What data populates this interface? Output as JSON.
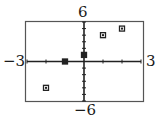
{
  "chart_data": {
    "type": "scatter",
    "title": "",
    "xlabel": "",
    "ylabel": "",
    "xlim": [
      -3,
      3
    ],
    "ylim": [
      -6,
      6
    ],
    "xscale": 1,
    "yscale": 1,
    "grid": false,
    "legend": null,
    "tick_labels": {
      "xmin": "−3",
      "xmax": "3",
      "ymin": "−6",
      "ymax": "6"
    },
    "series": [
      {
        "name": "data",
        "marker": "square",
        "points": [
          {
            "x": -2,
            "y": -4
          },
          {
            "x": -1,
            "y": 0
          },
          {
            "x": 0,
            "y": 1
          },
          {
            "x": 1,
            "y": 4
          },
          {
            "x": 2,
            "y": 5
          }
        ]
      }
    ]
  },
  "style": {
    "axis_color": "#222222",
    "frame_color": "#555555",
    "marker_color": "#222222"
  }
}
